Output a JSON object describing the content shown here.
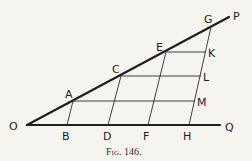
{
  "caption": "Fig. 146.",
  "colors": {
    "background": "#f6f4ef",
    "ink": "#1e1e1e"
  },
  "points": {
    "O": {
      "label": "O",
      "x": 27,
      "y": 125
    },
    "P": {
      "label": "P",
      "x": 229,
      "y": 17
    },
    "Q": {
      "label": "Q",
      "x": 220,
      "y": 125
    },
    "A": {
      "label": "A",
      "x": 73,
      "y": 101
    },
    "C": {
      "label": "C",
      "x": 121,
      "y": 76
    },
    "E": {
      "label": "E",
      "x": 166,
      "y": 52
    },
    "G": {
      "label": "G",
      "x": 211,
      "y": 27
    },
    "B": {
      "label": "B",
      "x": 67,
      "y": 125
    },
    "D": {
      "label": "D",
      "x": 108,
      "y": 125
    },
    "F": {
      "label": "F",
      "x": 148,
      "y": 125
    },
    "H": {
      "label": "H",
      "x": 189,
      "y": 125
    },
    "K": {
      "label": "K",
      "x": 206,
      "y": 52
    },
    "L": {
      "label": "L",
      "x": 201,
      "y": 76
    },
    "M": {
      "label": "M",
      "x": 195,
      "y": 101
    }
  },
  "segments": {
    "thick": [
      [
        "O",
        "P"
      ],
      [
        "O",
        "Q"
      ]
    ],
    "thin": [
      [
        "A",
        "B"
      ],
      [
        "C",
        "D"
      ],
      [
        "E",
        "F"
      ],
      [
        "G",
        "H"
      ],
      [
        "A",
        "M"
      ],
      [
        "C",
        "L"
      ],
      [
        "E",
        "K"
      ]
    ]
  }
}
